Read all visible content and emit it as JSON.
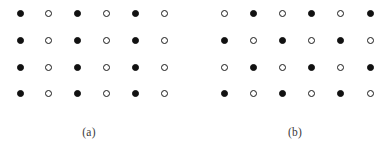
{
  "figure": {
    "background_color": "#ffffff",
    "width": 388,
    "height": 151,
    "filled_color": "#111111",
    "open_fill_color": "#ffffff",
    "open_stroke_color": "#1a1a1a",
    "caption_color": "#3a3a3a",
    "dot_diameter": 7
  },
  "chart_data": {
    "type": "scatter",
    "title": "",
    "subtitle": "",
    "xlabel": "",
    "ylabel": "",
    "grid": false,
    "legend": null,
    "legend_position": "none",
    "marker_types": [
      {
        "key": "filled",
        "label": "filled circle",
        "fill": "#111111",
        "stroke": "#111111"
      },
      {
        "key": "open",
        "label": "open circle",
        "fill": "#ffffff",
        "stroke": "#1a1a1a"
      }
    ],
    "panels": [
      {
        "id": "a",
        "caption": "(a)",
        "caption_x": 89,
        "caption_y": 133,
        "pattern": "column-striped",
        "rows": 4,
        "cols": 6,
        "x_positions": [
          20,
          48,
          77,
          106,
          135,
          164
        ],
        "y_positions": [
          13,
          40,
          67,
          93
        ],
        "cells": [
          [
            "filled",
            "open",
            "filled",
            "open",
            "filled",
            "open"
          ],
          [
            "filled",
            "open",
            "filled",
            "open",
            "filled",
            "open"
          ],
          [
            "filled",
            "open",
            "filled",
            "open",
            "filled",
            "open"
          ],
          [
            "filled",
            "open",
            "filled",
            "open",
            "filled",
            "open"
          ]
        ]
      },
      {
        "id": "b",
        "caption": "(b)",
        "caption_x": 295,
        "caption_y": 133,
        "pattern": "checkerboard",
        "rows": 4,
        "cols": 6,
        "x_positions": [
          224,
          253,
          282,
          311,
          340,
          370
        ],
        "y_positions": [
          13,
          40,
          67,
          93
        ],
        "cells": [
          [
            "open",
            "filled",
            "open",
            "filled",
            "open",
            "filled"
          ],
          [
            "filled",
            "open",
            "filled",
            "open",
            "filled",
            "open"
          ],
          [
            "open",
            "filled",
            "open",
            "filled",
            "open",
            "filled"
          ],
          [
            "filled",
            "open",
            "filled",
            "open",
            "filled",
            "open"
          ]
        ]
      }
    ]
  }
}
